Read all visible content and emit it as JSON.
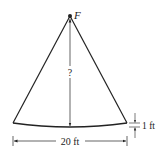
{
  "diagram": {
    "focus_label": "F",
    "unknown_label": "?",
    "width_label": "20 ft",
    "depth_label": "1 ft",
    "colors": {
      "line": "#222222",
      "background": "#ffffff"
    }
  }
}
